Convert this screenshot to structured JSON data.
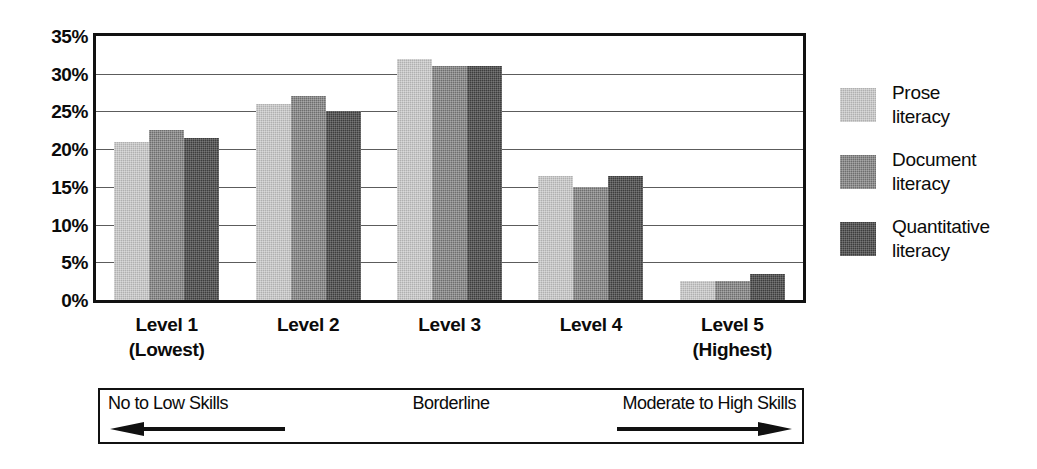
{
  "chart_data": {
    "type": "bar",
    "title": "",
    "subtitle": "",
    "xlabel": "",
    "ylabel": "",
    "categories": [
      "Level 1 (Lowest)",
      "Level 2",
      "Level 3",
      "Level 4",
      "Level 5 (Highest)"
    ],
    "category_lines": [
      {
        "line1": "Level 1",
        "line2": "(Lowest)"
      },
      {
        "line1": "Level 2",
        "line2": ""
      },
      {
        "line1": "Level 3",
        "line2": ""
      },
      {
        "line1": "Level 4",
        "line2": ""
      },
      {
        "line1": "Level 5",
        "line2": "(Highest)"
      }
    ],
    "series": [
      {
        "name": "Prose literacy",
        "values": [
          21.0,
          26.0,
          32.0,
          16.5,
          2.5
        ],
        "color": "#b0b0b0"
      },
      {
        "name": "Document literacy",
        "values": [
          22.5,
          27.0,
          31.0,
          15.0,
          2.5
        ],
        "color": "#6e6e6e"
      },
      {
        "name": "Quantitative literacy",
        "values": [
          21.5,
          25.0,
          31.0,
          16.5,
          3.5
        ],
        "color": "#3d3d3d"
      }
    ],
    "ylim": [
      0,
      35
    ],
    "ytick_values": [
      0,
      5,
      10,
      15,
      20,
      25,
      30,
      35
    ],
    "ytick_labels": [
      "0%",
      "5%",
      "10%",
      "15%",
      "20%",
      "25%",
      "30%",
      "35%"
    ],
    "grid": true,
    "grid_axis": "y",
    "legend_position": "right"
  },
  "legend": {
    "entries": [
      {
        "line1": "Prose",
        "line2": "literacy",
        "swatch": "light-gray-swatch"
      },
      {
        "line1": "Document",
        "line2": "literacy",
        "swatch": "medium-gray-swatch"
      },
      {
        "line1": "Quantitative",
        "line2": "literacy",
        "swatch": "dark-gray-swatch"
      }
    ]
  },
  "skills_band": {
    "left_label": "No to Low Skills",
    "middle_label": "Borderline",
    "right_label": "Moderate to High Skills",
    "left_arrow": "left-arrow-icon",
    "right_arrow": "right-arrow-icon"
  }
}
